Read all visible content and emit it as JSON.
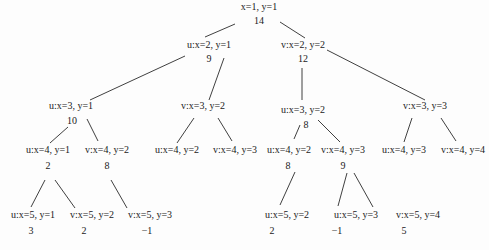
{
  "diagram": {
    "type": "tree",
    "nodes": [
      {
        "id": "n0",
        "label": "x=1, y=1",
        "value": "14",
        "lx": 259,
        "ly": 10,
        "vx": 259,
        "vy": 24
      },
      {
        "id": "n1",
        "label": "u:x=2, y=1",
        "value": "9",
        "lx": 209,
        "ly": 48,
        "vx": 209,
        "vy": 62
      },
      {
        "id": "n2",
        "label": "v:x=2, y=2",
        "value": "12",
        "lx": 303,
        "ly": 48,
        "vx": 303,
        "vy": 62
      },
      {
        "id": "n3",
        "label": "u:x=3, y=1",
        "value": "10",
        "lx": 71,
        "ly": 109,
        "vx": 72,
        "vy": 124
      },
      {
        "id": "n4",
        "label": "v:x=3, y=2",
        "value": "",
        "lx": 203,
        "ly": 109,
        "vx": 0,
        "vy": 0
      },
      {
        "id": "n5",
        "label": "u:x=3, y=2",
        "value": "8",
        "lx": 303,
        "ly": 113,
        "vx": 306,
        "vy": 128
      },
      {
        "id": "n6",
        "label": "v:x=3, y=3",
        "value": "",
        "lx": 425,
        "ly": 109,
        "vx": 0,
        "vy": 0
      },
      {
        "id": "n7",
        "label": "u:x=4, y=1",
        "value": "2",
        "lx": 48,
        "ly": 153,
        "vx": 48,
        "vy": 169
      },
      {
        "id": "n8",
        "label": "v:x=4, y=2",
        "value": "8",
        "lx": 107,
        "ly": 153,
        "vx": 107,
        "vy": 169
      },
      {
        "id": "n9",
        "label": "u:x=4, y=2",
        "value": "",
        "lx": 177,
        "ly": 153,
        "vx": 0,
        "vy": 0
      },
      {
        "id": "n10",
        "label": "v:x=4, y=3",
        "value": "",
        "lx": 235,
        "ly": 153,
        "vx": 0,
        "vy": 0
      },
      {
        "id": "n11",
        "label": "u:x=4, y=2",
        "value": "8",
        "lx": 289,
        "ly": 153,
        "vx": 288,
        "vy": 169
      },
      {
        "id": "n12",
        "label": "v:x=4, y=3",
        "value": "9",
        "lx": 343,
        "ly": 153,
        "vx": 343,
        "vy": 169
      },
      {
        "id": "n13",
        "label": "u:x=4, y=3",
        "value": "",
        "lx": 404,
        "ly": 153,
        "vx": 0,
        "vy": 0
      },
      {
        "id": "n14",
        "label": "v:x=4, y=4",
        "value": "",
        "lx": 463,
        "ly": 153,
        "vx": 0,
        "vy": 0
      },
      {
        "id": "n15",
        "label": "u:x=5, y=1",
        "value": "3",
        "lx": 33,
        "ly": 218,
        "vx": 31,
        "vy": 234
      },
      {
        "id": "n16",
        "label": "v:x=5, y=2",
        "value": "2",
        "lx": 92,
        "ly": 218,
        "vx": 84,
        "vy": 234
      },
      {
        "id": "n17",
        "label": "v:x=5, y=3",
        "value": "−1",
        "lx": 150,
        "ly": 218,
        "vx": 147,
        "vy": 234
      },
      {
        "id": "n18",
        "label": "u:x=5, y=2",
        "value": "2",
        "lx": 287,
        "ly": 218,
        "vx": 272,
        "vy": 234
      },
      {
        "id": "n19",
        "label": "u:x=5, y=3",
        "value": "−1",
        "lx": 356,
        "ly": 218,
        "vx": 337,
        "vy": 234
      },
      {
        "id": "n20",
        "label": "v:x=5, y=4",
        "value": "5",
        "lx": 418,
        "ly": 218,
        "vx": 404,
        "vy": 234
      }
    ],
    "edges": [
      {
        "x1": 235,
        "y1": 24,
        "x2": 205,
        "y2": 37
      },
      {
        "x1": 280,
        "y1": 22,
        "x2": 305,
        "y2": 38
      },
      {
        "x1": 185,
        "y1": 56,
        "x2": 90,
        "y2": 100
      },
      {
        "x1": 224,
        "y1": 58,
        "x2": 209,
        "y2": 100
      },
      {
        "x1": 327,
        "y1": 50,
        "x2": 425,
        "y2": 100
      },
      {
        "x1": 302,
        "y1": 68,
        "x2": 302,
        "y2": 100
      },
      {
        "x1": 68,
        "y1": 127,
        "x2": 50,
        "y2": 143
      },
      {
        "x1": 87,
        "y1": 119,
        "x2": 98,
        "y2": 141
      },
      {
        "x1": 194,
        "y1": 118,
        "x2": 177,
        "y2": 143
      },
      {
        "x1": 218,
        "y1": 118,
        "x2": 232,
        "y2": 141
      },
      {
        "x1": 300,
        "y1": 125,
        "x2": 294,
        "y2": 139
      },
      {
        "x1": 318,
        "y1": 120,
        "x2": 340,
        "y2": 142
      },
      {
        "x1": 412,
        "y1": 118,
        "x2": 404,
        "y2": 142
      },
      {
        "x1": 441,
        "y1": 118,
        "x2": 456,
        "y2": 141
      },
      {
        "x1": 45,
        "y1": 180,
        "x2": 31,
        "y2": 207
      },
      {
        "x1": 55,
        "y1": 180,
        "x2": 75,
        "y2": 208
      },
      {
        "x1": 111,
        "y1": 180,
        "x2": 127,
        "y2": 208
      },
      {
        "x1": 295,
        "y1": 172,
        "x2": 280,
        "y2": 205
      },
      {
        "x1": 347,
        "y1": 173,
        "x2": 338,
        "y2": 206
      },
      {
        "x1": 354,
        "y1": 173,
        "x2": 373,
        "y2": 207
      }
    ]
  }
}
